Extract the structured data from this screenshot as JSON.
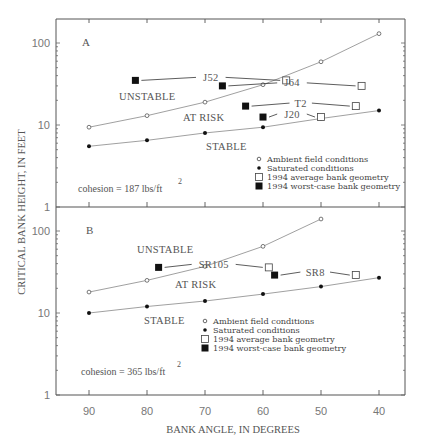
{
  "figure": {
    "ylabel": "CRITICAL BANK HEIGHT, IN FEET",
    "xlabel": "BANK ANGLE, IN DEGREES",
    "x_ticks": [
      "90",
      "80",
      "70",
      "60",
      "50",
      "40"
    ],
    "y_ticks": [
      "1",
      "10",
      "100"
    ]
  },
  "panels": [
    {
      "id": "A",
      "label": "A",
      "cohesion_label": "cohesion = 187 lbs/ft",
      "cohesion_exp": "2",
      "regions": {
        "unstable": "UNSTABLE",
        "at_risk": "AT RISK",
        "stable": "STABLE"
      },
      "site_labels": [
        "J52",
        "J64",
        "T2",
        "J20"
      ],
      "legend": [
        {
          "symbol": "open-circle",
          "label": "Ambient field conditions"
        },
        {
          "symbol": "filled-circle",
          "label": "Saturated conditions"
        },
        {
          "symbol": "open-square",
          "label": "1994 average bank geometry"
        },
        {
          "symbol": "filled-square",
          "label": "1994 worst-case bank geometry"
        }
      ]
    },
    {
      "id": "B",
      "label": "B",
      "cohesion_label": "cohesion = 365 lbs/ft",
      "cohesion_exp": "2",
      "regions": {
        "unstable": "UNSTABLE",
        "at_risk": "AT RISK",
        "stable": "STABLE"
      },
      "site_labels": [
        "SR105",
        "SR8"
      ],
      "legend": [
        {
          "symbol": "open-circle",
          "label": "Ambient field conditions"
        },
        {
          "symbol": "filled-circle",
          "label": "Saturated conditions"
        },
        {
          "symbol": "open-square",
          "label": "1994 average bank geometry"
        },
        {
          "symbol": "filled-square",
          "label": "1994 worst-case bank geometry"
        }
      ]
    }
  ],
  "chart_data": [
    {
      "type": "line",
      "title": "A",
      "annotation": "cohesion = 187 lbs/ft^2",
      "xlabel": "BANK ANGLE, IN DEGREES",
      "ylabel": "CRITICAL BANK HEIGHT, IN FEET",
      "xlim": [
        95,
        35
      ],
      "ylim": [
        1,
        200
      ],
      "yscale": "log",
      "x_ticks": [
        90,
        80,
        70,
        60,
        50,
        40
      ],
      "y_ticks": [
        1,
        10,
        100
      ],
      "grid": false,
      "legend_position": "lower right",
      "series": [
        {
          "name": "Ambient field conditions",
          "marker": "open-circle",
          "x": [
            90,
            80,
            70,
            60,
            50,
            40
          ],
          "y": [
            9.4,
            13,
            19,
            31,
            59,
            130
          ]
        },
        {
          "name": "Saturated conditions",
          "marker": "filled-circle",
          "x": [
            90,
            80,
            70,
            60,
            50,
            40
          ],
          "y": [
            5.5,
            6.5,
            8,
            9.4,
            12,
            15
          ]
        }
      ],
      "sites": [
        {
          "name": "J52",
          "worst_case": {
            "x": 82,
            "y": 35
          },
          "average": {
            "x": 56,
            "y": 35
          }
        },
        {
          "name": "J64",
          "worst_case": {
            "x": 67,
            "y": 30
          },
          "average": {
            "x": 43,
            "y": 30
          }
        },
        {
          "name": "T2",
          "worst_case": {
            "x": 63,
            "y": 17
          },
          "average": {
            "x": 44,
            "y": 17
          }
        },
        {
          "name": "J20",
          "worst_case": {
            "x": 60,
            "y": 12.5
          },
          "average": {
            "x": 50,
            "y": 12.5
          }
        }
      ],
      "regions": [
        "UNSTABLE",
        "AT RISK",
        "STABLE"
      ]
    },
    {
      "type": "line",
      "title": "B",
      "annotation": "cohesion = 365 lbs/ft^2",
      "xlabel": "BANK ANGLE, IN DEGREES",
      "ylabel": "CRITICAL BANK HEIGHT, IN FEET",
      "xlim": [
        95,
        35
      ],
      "ylim": [
        1,
        200
      ],
      "yscale": "log",
      "x_ticks": [
        90,
        80,
        70,
        60,
        50,
        40
      ],
      "y_ticks": [
        1,
        10,
        100
      ],
      "grid": false,
      "legend_position": "center right",
      "series": [
        {
          "name": "Ambient field conditions",
          "marker": "open-circle",
          "x": [
            90,
            80,
            70,
            60,
            50
          ],
          "y": [
            18,
            25,
            37,
            65,
            140
          ]
        },
        {
          "name": "Saturated conditions",
          "marker": "filled-circle",
          "x": [
            90,
            80,
            70,
            60,
            50,
            40
          ],
          "y": [
            10,
            12,
            14,
            17,
            21,
            27
          ]
        }
      ],
      "sites": [
        {
          "name": "SR105",
          "worst_case": {
            "x": 78,
            "y": 36
          },
          "average": {
            "x": 59,
            "y": 36
          }
        },
        {
          "name": "SR8",
          "worst_case": {
            "x": 58,
            "y": 29
          },
          "average": {
            "x": 44,
            "y": 29
          }
        }
      ],
      "regions": [
        "UNSTABLE",
        "AT RISK",
        "STABLE"
      ]
    }
  ]
}
